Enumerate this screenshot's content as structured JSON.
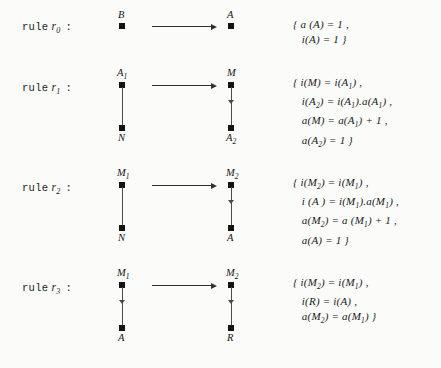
{
  "document": {
    "kind": "graph-rewriting-rules-figure",
    "background_color": "#fbfbfa",
    "ink_color": "#1c1c1c"
  },
  "rules": [
    {
      "label_prefix": "rule",
      "name": "r",
      "index": "0",
      "colon": ":",
      "lhs": {
        "nodes": [
          {
            "label": "B",
            "subscript": "",
            "position": "top"
          }
        ],
        "edge": "none"
      },
      "rhs": {
        "nodes": [
          {
            "label": "A",
            "subscript": "",
            "position": "top"
          }
        ],
        "edge": "none"
      },
      "equations": [
        "{ a (A) = 1 ,",
        "   i(A) = 1 }"
      ],
      "equations_html": [
        "{ a (A) = 1 ,",
        "   i(A) = 1 }"
      ]
    },
    {
      "label_prefix": "rule",
      "name": "r",
      "index": "1",
      "colon": ":",
      "lhs": {
        "nodes": [
          {
            "label": "A",
            "subscript": "1",
            "position": "top"
          },
          {
            "label": "N",
            "subscript": "",
            "position": "bottom"
          }
        ],
        "edge": "plain"
      },
      "rhs": {
        "nodes": [
          {
            "label": "M",
            "subscript": "",
            "position": "top"
          },
          {
            "label": "A",
            "subscript": "2",
            "position": "bottom"
          }
        ],
        "edge": "directed"
      },
      "equations": [
        "{ i(M) = i(A1) ,",
        "   i(A2) = i(A1).a(A1) ,",
        "   a(M) = a(A1) + 1 ,",
        "   a(A2) = 1 }"
      ],
      "equations_html": [
        "{ i(M) = i(A<sub>1</sub>) ,",
        "   i(A<sub>2</sub>) = i(A<sub>1</sub>).a(A<sub>1</sub>) ,",
        "   a(M) = a(A<sub>1</sub>) + 1 ,",
        "   a(A<sub>2</sub>) = 1 }"
      ]
    },
    {
      "label_prefix": "rule",
      "name": "r",
      "index": "2",
      "colon": ":",
      "lhs": {
        "nodes": [
          {
            "label": "M",
            "subscript": "1",
            "position": "top"
          },
          {
            "label": "N",
            "subscript": "",
            "position": "bottom"
          }
        ],
        "edge": "plain"
      },
      "rhs": {
        "nodes": [
          {
            "label": "M",
            "subscript": "2",
            "position": "top"
          },
          {
            "label": "A",
            "subscript": "",
            "position": "bottom"
          }
        ],
        "edge": "directed"
      },
      "equations": [
        "{ i(M2) = i(M1) ,",
        "   i (A ) = i(M1).a(M1) ,",
        "   a(M2) = a (M1) + 1 ,",
        "   a(A) = 1 }"
      ],
      "equations_html": [
        "{ i(M<sub>2</sub>) = i(M<sub>1</sub>) ,",
        "   i (A ) = i(M<sub>1</sub>).a(M<sub>1</sub>) ,",
        "   a(M<sub>2</sub>) = a (M<sub>1</sub>) + 1 ,",
        "   a(A) = 1 }"
      ]
    },
    {
      "label_prefix": "rule",
      "name": "r",
      "index": "3",
      "colon": ":",
      "lhs": {
        "nodes": [
          {
            "label": "M",
            "subscript": "1",
            "position": "top"
          },
          {
            "label": "A",
            "subscript": "",
            "position": "bottom"
          }
        ],
        "edge": "directed"
      },
      "rhs": {
        "nodes": [
          {
            "label": "M",
            "subscript": "2",
            "position": "top"
          },
          {
            "label": "R",
            "subscript": "",
            "position": "bottom"
          }
        ],
        "edge": "directed"
      },
      "equations": [
        "{ i(M2) = i(M1) ,",
        "   i(R) = i(A) ,",
        "   a(M2) = a(M1) }"
      ],
      "equations_html": [
        "{ i(M<sub>2</sub>) = i(M<sub>1</sub>) ,",
        "   i(R) = i(A) ,",
        "   a(M<sub>2</sub>) = a(M<sub>1</sub>) }"
      ]
    }
  ]
}
